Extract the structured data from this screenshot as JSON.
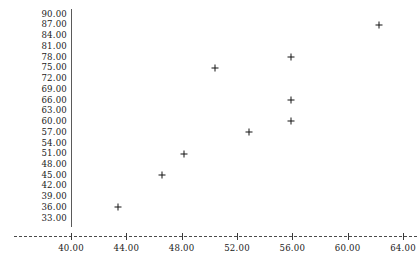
{
  "chart_data": {
    "type": "scatter",
    "title": "",
    "subtitle": "",
    "xlabel": "",
    "ylabel": "",
    "xlim": [
      38.0,
      65.0
    ],
    "ylim": [
      32.0,
      91.0
    ],
    "grid": false,
    "legend": null,
    "marker": "plus",
    "marker_color": "#141414",
    "axis_color": "#4a4a4a",
    "x_tick_labels": [
      "40.00",
      "44.00",
      "48.00",
      "52.00",
      "56.00",
      "60.00",
      "64.00"
    ],
    "x_ticks": [
      40.0,
      44.0,
      48.0,
      52.0,
      56.0,
      60.0,
      64.0
    ],
    "y_tick_labels": [
      "90.00",
      "87.00",
      "84.00",
      "81.00",
      "78.00",
      "75.00",
      "72.00",
      "69.00",
      "66.00",
      "63.00",
      "60.00",
      "57.00",
      "54.00",
      "51.00",
      "48.00",
      "45.00",
      "42.00",
      "39.00",
      "36.00",
      "33.00"
    ],
    "y_ticks": [
      90.0,
      87.0,
      84.0,
      81.0,
      78.0,
      75.0,
      72.0,
      69.0,
      66.0,
      63.0,
      60.0,
      57.0,
      54.0,
      51.0,
      48.0,
      45.0,
      42.0,
      39.0,
      36.0,
      33.0
    ],
    "points": [
      {
        "x": 43.4,
        "y": 36.0
      },
      {
        "x": 46.6,
        "y": 45.0
      },
      {
        "x": 48.2,
        "y": 51.0
      },
      {
        "x": 50.4,
        "y": 75.0
      },
      {
        "x": 52.9,
        "y": 57.0
      },
      {
        "x": 55.9,
        "y": 60.0
      },
      {
        "x": 55.9,
        "y": 66.0
      },
      {
        "x": 55.9,
        "y": 78.0
      },
      {
        "x": 62.3,
        "y": 87.0
      }
    ],
    "series": [
      {
        "name": "series-1",
        "x": [
          43.4,
          46.6,
          48.2,
          50.4,
          52.9,
          55.9,
          55.9,
          55.9,
          62.3
        ],
        "y": [
          36.0,
          45.0,
          51.0,
          75.0,
          57.0,
          60.0,
          66.0,
          78.0,
          87.0
        ]
      }
    ]
  },
  "layout": {
    "plot_left_px": 71,
    "plot_right_px": 403,
    "plot_top_px": 14,
    "plot_bottom_px": 218,
    "axis_baseline_px": 236,
    "x_label_row_px": 244
  }
}
